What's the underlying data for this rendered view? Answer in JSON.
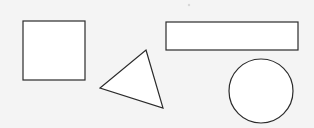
{
  "figure": {
    "background_color": "#f4f4f4",
    "stroke_color": "#2b2b2b",
    "fill_color": "#ffffff",
    "stroke_width": 1.2,
    "canvas": {
      "width": 314,
      "height": 128
    },
    "shape_count": 4,
    "shapes": [
      {
        "id": "square",
        "label": "Square",
        "type": "rect",
        "x": 23,
        "y": 21,
        "width": 62,
        "height": 59
      },
      {
        "id": "triangle",
        "label": "Triangle",
        "type": "polygon",
        "points": "146,50 163,108 100,88",
        "vertices": [
          {
            "x": 146,
            "y": 50
          },
          {
            "x": 163,
            "y": 108
          },
          {
            "x": 100,
            "y": 88
          }
        ]
      },
      {
        "id": "rectangle",
        "label": "Rectangle",
        "type": "rect",
        "x": 166,
        "y": 22,
        "width": 132,
        "height": 28
      },
      {
        "id": "circle",
        "label": "Circle",
        "type": "ellipse",
        "cx": 261,
        "cy": 91,
        "rx": 32,
        "ry": 32
      }
    ],
    "marks": [
      {
        "id": "speck",
        "label": "Paper speck",
        "type": "dot",
        "cx": 189,
        "cy": 5,
        "r": 1.2
      }
    ]
  }
}
